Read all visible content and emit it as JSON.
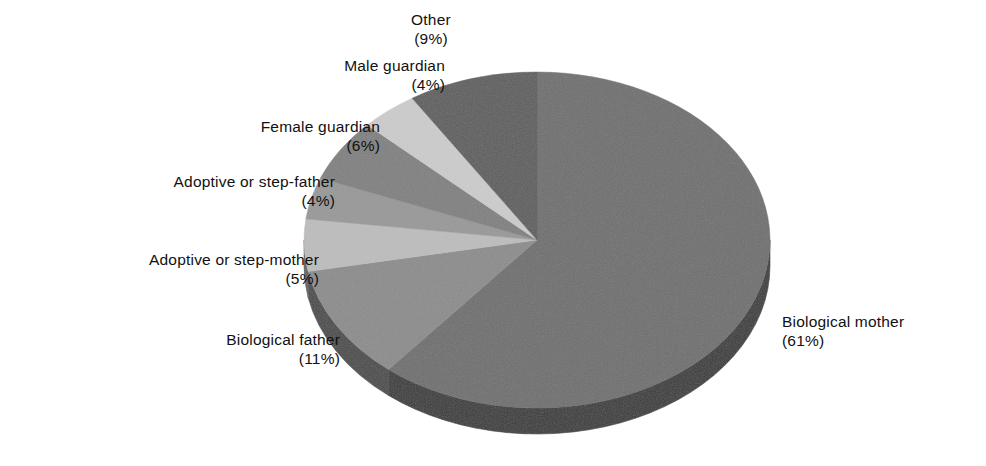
{
  "chart_data": {
    "type": "pie",
    "title": "",
    "subtitle": "",
    "xlabel": "",
    "ylabel": "",
    "grid": false,
    "legend_position": "callout-labels",
    "three_d": true,
    "units": "percent",
    "categories": [
      "Biological mother",
      "Biological father",
      "Adoptive or step-mother",
      "Adoptive or step-father",
      "Female guardian",
      "Male guardian",
      "Other"
    ],
    "values": [
      61,
      11,
      5,
      4,
      6,
      4,
      9
    ],
    "slices": [
      {
        "label": "Biological mother",
        "value": 61,
        "display": "(61%)",
        "color": "#6f6f6f",
        "side_color": "#3a3a3a"
      },
      {
        "label": "Biological father",
        "value": 11,
        "display": "(11%)",
        "color": "#8c8c8c",
        "side_color": "#4a4a4a"
      },
      {
        "label": "Adoptive or step-mother",
        "value": 5,
        "display": "(5%)",
        "color": "#bdbdbd",
        "side_color": "#636363"
      },
      {
        "label": "Adoptive or step-father",
        "value": 4,
        "display": "(4%)",
        "color": "#989898",
        "side_color": "#515151"
      },
      {
        "label": "Female guardian",
        "value": 6,
        "display": "(6%)",
        "color": "#808080",
        "side_color": "#444444"
      },
      {
        "label": "Male guardian",
        "value": 4,
        "display": "(4%)",
        "color": "#cccccc",
        "side_color": "#6b6b6b"
      },
      {
        "label": "Other",
        "value": 9,
        "display": "(9%)",
        "color": "#5e5e5e",
        "side_color": "#323232"
      }
    ]
  },
  "labels": {
    "other": {
      "name": "Other",
      "pct": "(9%)"
    },
    "male_guard": {
      "name": "Male guardian",
      "pct": "(4%)"
    },
    "female_guard": {
      "name": "Female guardian",
      "pct": "(6%)"
    },
    "adopt_father": {
      "name": "Adoptive or step-father",
      "pct": "(4%)"
    },
    "adopt_mother": {
      "name": "Adoptive or step-mother",
      "pct": "(5%)"
    },
    "bio_father": {
      "name": "Biological father",
      "pct": "(11%)"
    },
    "bio_mother": {
      "name": "Biological mother",
      "pct": "(61%)"
    }
  },
  "colors": {
    "background": "#ffffff",
    "text": "#111111",
    "slice_biological_mother": "#6f6f6f",
    "slice_biological_father": "#8c8c8c",
    "slice_adoptive_step_mother": "#bdbdbd",
    "slice_adoptive_step_father": "#989898",
    "slice_female_guardian": "#808080",
    "slice_male_guardian": "#cccccc",
    "slice_other": "#5e5e5e",
    "rim_dark": "#333333"
  }
}
